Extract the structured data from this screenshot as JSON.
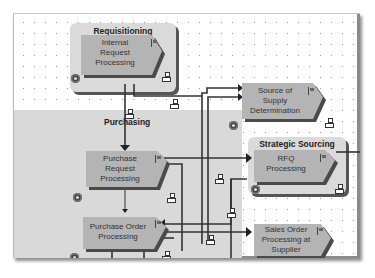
{
  "diagram": {
    "groups": [
      {
        "id": "requisitioning",
        "title": "Requisitioning"
      },
      {
        "id": "purchasing",
        "title": "Purchasing"
      },
      {
        "id": "strategic_sourcing",
        "title": "Strategic Sourcing"
      }
    ],
    "steps": [
      {
        "id": "internal_request",
        "label_lines": [
          "Internal",
          "Request",
          "Processing"
        ],
        "label": "Internal Request Processing"
      },
      {
        "id": "source_of_supply",
        "label_lines": [
          "Source of",
          "Supply",
          "Determination"
        ],
        "label": "Source of Supply Determination"
      },
      {
        "id": "purchase_request",
        "label_lines": [
          "Purchase",
          "Request",
          "Processing"
        ],
        "label": "Purchase Request Processing"
      },
      {
        "id": "rfq",
        "label_lines": [
          "RFQ",
          "Processing"
        ],
        "label": "RFQ Processing"
      },
      {
        "id": "purchase_order",
        "label_lines": [
          "Purchase Order",
          "Processing"
        ],
        "label": "Purchase Order Processing"
      },
      {
        "id": "sales_order",
        "label_lines": [
          "Sales Order",
          "Processing at",
          "Supplier"
        ],
        "label": "Sales Order Processing at Supplier"
      }
    ],
    "colors": {
      "step_fill": "#b4b4b4",
      "step_shadow": "#4a4a4a",
      "group_fill": "#dadada",
      "lane_fill": "#d9d9d9",
      "connector": "#333333"
    }
  }
}
